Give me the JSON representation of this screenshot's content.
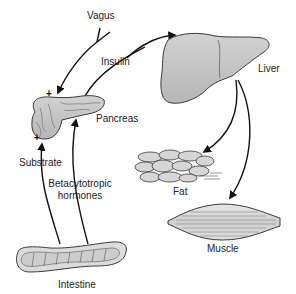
{
  "diagram": {
    "organs": {
      "pancreas": {
        "label": "Pancreas"
      },
      "liver": {
        "label": "Liver"
      },
      "fat": {
        "label": "Fat"
      },
      "muscle": {
        "label": "Muscle"
      },
      "intestine": {
        "label": "Intestine"
      }
    },
    "signals": {
      "vagus": {
        "label": "Vagus",
        "sign": "+"
      },
      "insulin": {
        "label": "Insulin"
      },
      "substrate": {
        "label": "Substrate",
        "sign": "+"
      },
      "betacytotropic": {
        "label_line1": "Betacytotropic",
        "label_line2": "hormones"
      }
    },
    "colors": {
      "organ_fill": "#c4c4c4",
      "organ_stroke": "#3a3a3a",
      "arrow": "#111111",
      "text": "#222222",
      "background": "#ffffff"
    }
  }
}
